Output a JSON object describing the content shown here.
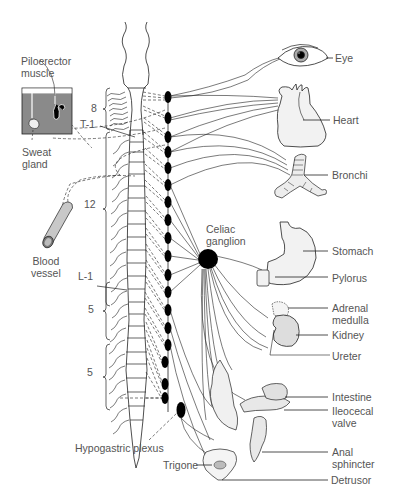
{
  "diagram": {
    "colors": {
      "line": "#222222",
      "label": "#555555",
      "organ_fill": "#e8e8e8",
      "skin_fill": "#8a8a8a",
      "ganglion": "#000000"
    },
    "left_labels": {
      "piloerector": [
        "Piloerector",
        "muscle"
      ],
      "sweat": [
        "Sweat",
        "gland"
      ],
      "blood": [
        "Blood",
        "vessel"
      ]
    },
    "segment_labels": {
      "cervical_count": "8",
      "t1": "T-1",
      "thoracic_count": "12",
      "l1": "L-1",
      "lumbar_count": "5",
      "sacral_count": "5"
    },
    "ganglia_labels": {
      "celiac": [
        "Celiac",
        "ganglion"
      ],
      "hypogastric": "Hypogastric plexus"
    },
    "organs": [
      {
        "id": "eye",
        "label": [
          "Eye"
        ]
      },
      {
        "id": "heart",
        "label": [
          "Heart"
        ]
      },
      {
        "id": "bronchi",
        "label": [
          "Bronchi"
        ]
      },
      {
        "id": "stomach",
        "label": [
          "Stomach"
        ]
      },
      {
        "id": "pylorus",
        "label": [
          "Pylorus"
        ]
      },
      {
        "id": "adrenal",
        "label": [
          "Adrenal",
          "medulla"
        ]
      },
      {
        "id": "kidney",
        "label": [
          "Kidney"
        ]
      },
      {
        "id": "ureter",
        "label": [
          "Ureter"
        ]
      },
      {
        "id": "intestine",
        "label": [
          "Intestine"
        ]
      },
      {
        "id": "ileocecal",
        "label": [
          "Ileocecal",
          "valve"
        ]
      },
      {
        "id": "anal",
        "label": [
          "Anal",
          "sphincter"
        ]
      },
      {
        "id": "trigone",
        "label": [
          "Trigone"
        ]
      },
      {
        "id": "detrusor",
        "label": [
          "Detrusor"
        ]
      }
    ]
  }
}
